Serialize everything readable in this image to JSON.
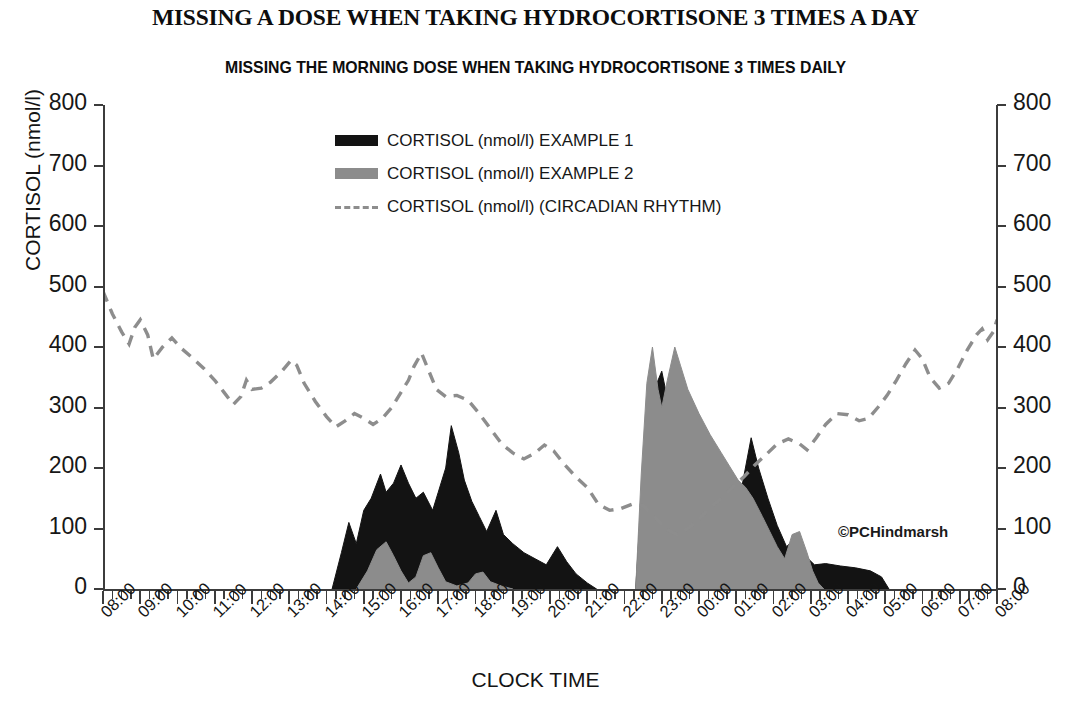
{
  "title": "MISSING A DOSE WHEN TAKING HYDROCORTISONE 3 TIMES A DAY",
  "subtitle": "MISSING THE MORNING DOSE WHEN TAKING HYDROCORTISONE 3 TIMES DAILY",
  "credit": "©PCHindmarsh",
  "colors": {
    "example1": "#131313",
    "example2": "#8c8c8c",
    "circadian": "#8d8d8d",
    "axis": "#3c3c3c",
    "text": "#141414",
    "background": "#ffffff"
  },
  "legend": [
    {
      "label": "CORTISOL (nmol/l) EXAMPLE 1",
      "marker": "filled-area-black",
      "color": "#131313"
    },
    {
      "label": "CORTISOL (nmol/l) EXAMPLE 2",
      "marker": "filled-area-gray",
      "color": "#8c8c8c"
    },
    {
      "label": "CORTISOL (nmol/l) (CIRCADIAN RHYTHM)",
      "marker": "dashed-line",
      "color": "#8d8d8d"
    }
  ],
  "axes": {
    "x_title": "CLOCK TIME",
    "y_title": "CORTISOL (nmol/l)",
    "y_ticks": [
      0,
      100,
      200,
      300,
      400,
      500,
      600,
      700,
      800
    ],
    "y_ticks_right": [
      0,
      100,
      200,
      300,
      400,
      500,
      600,
      700,
      800
    ],
    "ylim": [
      0,
      800
    ],
    "x_ticks": [
      "08:00",
      "09:00",
      "10:00",
      "11:00",
      "12:00",
      "13:00",
      "14:00",
      "15:00",
      "16:00",
      "17:00",
      "18:00",
      "19:00",
      "20:00",
      "21:00",
      "22:00",
      "23:00",
      "00:00",
      "01:00",
      "02:00",
      "03:00",
      "04:00",
      "05:00",
      "06:00",
      "07:00",
      "08:00"
    ],
    "x_minor_per_hour": 3,
    "grid": false
  },
  "chart_data": {
    "type": "area",
    "title": "MISSING THE MORNING DOSE WHEN TAKING HYDROCORTISONE 3 TIMES DAILY",
    "xlabel": "CLOCK TIME",
    "ylabel": "CORTISOL (nmol/l)",
    "ylim": [
      0,
      800
    ],
    "x_start_hour": 8,
    "x_end_hour": 32,
    "x_hours": [
      8.0,
      8.5,
      9.0,
      9.5,
      10.0,
      10.5,
      11.0,
      11.5,
      12.0,
      12.5,
      13.0,
      13.5,
      14.0,
      14.5,
      15.0,
      15.5,
      16.0,
      16.5,
      17.0,
      17.5,
      18.0,
      18.5,
      19.0,
      19.5,
      20.0,
      20.5,
      21.0,
      21.5,
      22.0,
      22.5,
      23.0,
      23.5,
      24.0,
      24.5,
      25.0,
      25.5,
      26.0,
      26.5,
      27.0,
      27.5,
      28.0,
      28.5,
      29.0,
      29.5,
      30.0,
      30.5,
      31.0,
      31.5,
      32.0
    ],
    "series": [
      {
        "name": "CORTISOL (nmol/l) EXAMPLE 1",
        "color": "#131313",
        "style": "filled-area",
        "points": [
          [
            14.15,
            0
          ],
          [
            14.4,
            60
          ],
          [
            14.6,
            110
          ],
          [
            14.8,
            75
          ],
          [
            15.0,
            130
          ],
          [
            15.2,
            150
          ],
          [
            15.45,
            190
          ],
          [
            15.6,
            160
          ],
          [
            15.8,
            175
          ],
          [
            16.0,
            205
          ],
          [
            16.2,
            175
          ],
          [
            16.4,
            150
          ],
          [
            16.6,
            160
          ],
          [
            16.85,
            130
          ],
          [
            17.0,
            160
          ],
          [
            17.2,
            200
          ],
          [
            17.35,
            270
          ],
          [
            17.55,
            225
          ],
          [
            17.7,
            180
          ],
          [
            17.9,
            145
          ],
          [
            18.1,
            120
          ],
          [
            18.3,
            95
          ],
          [
            18.55,
            130
          ],
          [
            18.75,
            90
          ],
          [
            19.0,
            75
          ],
          [
            19.3,
            60
          ],
          [
            19.6,
            50
          ],
          [
            19.9,
            40
          ],
          [
            20.2,
            70
          ],
          [
            20.45,
            45
          ],
          [
            20.7,
            25
          ],
          [
            21.0,
            10
          ],
          [
            21.25,
            0
          ],
          [
            22.3,
            0
          ],
          [
            22.45,
            150
          ],
          [
            22.6,
            290
          ],
          [
            22.8,
            330
          ],
          [
            23.0,
            360
          ],
          [
            23.2,
            300
          ],
          [
            23.4,
            260
          ],
          [
            23.7,
            215
          ],
          [
            24.0,
            195
          ],
          [
            24.3,
            170
          ],
          [
            24.55,
            150
          ],
          [
            24.75,
            135
          ],
          [
            25.0,
            120
          ],
          [
            25.2,
            185
          ],
          [
            25.4,
            250
          ],
          [
            25.6,
            200
          ],
          [
            25.85,
            150
          ],
          [
            26.1,
            105
          ],
          [
            26.35,
            70
          ],
          [
            26.6,
            85
          ],
          [
            26.85,
            55
          ],
          [
            27.1,
            40
          ],
          [
            27.4,
            42
          ],
          [
            27.8,
            38
          ],
          [
            28.2,
            35
          ],
          [
            28.6,
            30
          ],
          [
            28.9,
            20
          ],
          [
            29.1,
            0
          ]
        ]
      },
      {
        "name": "CORTISOL (nmol/l) EXAMPLE 2",
        "color": "#8c8c8c",
        "style": "filled-area",
        "points": [
          [
            14.8,
            0
          ],
          [
            15.1,
            30
          ],
          [
            15.35,
            65
          ],
          [
            15.6,
            78
          ],
          [
            15.8,
            55
          ],
          [
            16.0,
            30
          ],
          [
            16.2,
            10
          ],
          [
            16.4,
            20
          ],
          [
            16.6,
            55
          ],
          [
            16.8,
            60
          ],
          [
            17.0,
            35
          ],
          [
            17.2,
            12
          ],
          [
            17.5,
            5
          ],
          [
            17.8,
            10
          ],
          [
            18.0,
            25
          ],
          [
            18.2,
            28
          ],
          [
            18.4,
            12
          ],
          [
            18.7,
            5
          ],
          [
            19.0,
            0
          ],
          [
            22.3,
            0
          ],
          [
            22.45,
            190
          ],
          [
            22.6,
            340
          ],
          [
            22.75,
            400
          ],
          [
            22.9,
            330
          ],
          [
            23.0,
            300
          ],
          [
            23.15,
            345
          ],
          [
            23.35,
            400
          ],
          [
            23.5,
            370
          ],
          [
            23.7,
            330
          ],
          [
            24.0,
            290
          ],
          [
            24.3,
            255
          ],
          [
            24.6,
            225
          ],
          [
            24.85,
            200
          ],
          [
            25.05,
            180
          ],
          [
            25.25,
            168
          ],
          [
            25.45,
            150
          ],
          [
            25.7,
            120
          ],
          [
            25.9,
            95
          ],
          [
            26.1,
            70
          ],
          [
            26.3,
            50
          ],
          [
            26.5,
            90
          ],
          [
            26.7,
            95
          ],
          [
            26.9,
            60
          ],
          [
            27.05,
            30
          ],
          [
            27.2,
            10
          ],
          [
            27.35,
            0
          ]
        ]
      },
      {
        "name": "CORTISOL (nmol/l) (CIRCADIAN RHYTHM)",
        "color": "#8d8d8d",
        "style": "dashed-line",
        "points": [
          [
            8.0,
            492
          ],
          [
            8.25,
            455
          ],
          [
            8.5,
            425
          ],
          [
            8.7,
            405
          ],
          [
            8.85,
            432
          ],
          [
            9.0,
            445
          ],
          [
            9.2,
            420
          ],
          [
            9.35,
            380
          ],
          [
            9.6,
            400
          ],
          [
            9.85,
            415
          ],
          [
            10.1,
            398
          ],
          [
            10.4,
            382
          ],
          [
            10.7,
            365
          ],
          [
            11.0,
            345
          ],
          [
            11.25,
            325
          ],
          [
            11.5,
            305
          ],
          [
            11.7,
            318
          ],
          [
            11.85,
            345
          ],
          [
            12.0,
            330
          ],
          [
            12.25,
            332
          ],
          [
            12.5,
            342
          ],
          [
            12.8,
            360
          ],
          [
            13.05,
            378
          ],
          [
            13.2,
            370
          ],
          [
            13.4,
            340
          ],
          [
            13.7,
            310
          ],
          [
            14.0,
            285
          ],
          [
            14.25,
            268
          ],
          [
            14.5,
            278
          ],
          [
            14.75,
            290
          ],
          [
            15.0,
            282
          ],
          [
            15.25,
            272
          ],
          [
            15.5,
            282
          ],
          [
            15.75,
            300
          ],
          [
            16.0,
            325
          ],
          [
            16.2,
            345
          ],
          [
            16.35,
            368
          ],
          [
            16.55,
            390
          ],
          [
            16.75,
            360
          ],
          [
            16.95,
            330
          ],
          [
            17.2,
            318
          ],
          [
            17.5,
            320
          ],
          [
            17.8,
            312
          ],
          [
            18.1,
            290
          ],
          [
            18.4,
            265
          ],
          [
            18.7,
            240
          ],
          [
            19.0,
            225
          ],
          [
            19.3,
            215
          ],
          [
            19.6,
            225
          ],
          [
            19.85,
            238
          ],
          [
            20.1,
            228
          ],
          [
            20.4,
            205
          ],
          [
            20.7,
            185
          ],
          [
            21.0,
            168
          ],
          [
            21.3,
            140
          ],
          [
            21.6,
            130
          ],
          [
            21.9,
            133
          ],
          [
            22.2,
            140
          ],
          [
            22.5,
            138
          ],
          [
            22.8,
            120
          ],
          [
            23.1,
            100
          ],
          [
            23.4,
            90
          ],
          [
            23.7,
            100
          ],
          [
            24.0,
            115
          ],
          [
            24.3,
            135
          ],
          [
            24.6,
            150
          ],
          [
            24.9,
            168
          ],
          [
            25.2,
            185
          ],
          [
            25.5,
            205
          ],
          [
            25.8,
            222
          ],
          [
            26.1,
            240
          ],
          [
            26.4,
            248
          ],
          [
            26.7,
            240
          ],
          [
            26.9,
            230
          ],
          [
            27.15,
            250
          ],
          [
            27.4,
            272
          ],
          [
            27.7,
            290
          ],
          [
            28.0,
            288
          ],
          [
            28.3,
            278
          ],
          [
            28.55,
            282
          ],
          [
            28.8,
            300
          ],
          [
            29.05,
            320
          ],
          [
            29.3,
            345
          ],
          [
            29.55,
            372
          ],
          [
            29.8,
            395
          ],
          [
            30.0,
            380
          ],
          [
            30.2,
            350
          ],
          [
            30.45,
            332
          ],
          [
            30.7,
            340
          ],
          [
            30.95,
            365
          ],
          [
            31.2,
            395
          ],
          [
            31.45,
            420
          ],
          [
            31.6,
            430
          ],
          [
            31.75,
            412
          ],
          [
            31.9,
            425
          ],
          [
            32.0,
            445
          ]
        ]
      }
    ]
  }
}
